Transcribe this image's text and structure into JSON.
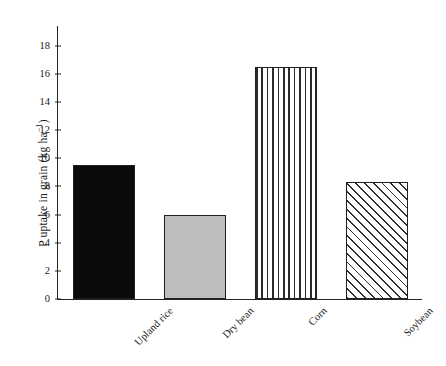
{
  "chart_data": {
    "type": "bar",
    "title": "",
    "subtitle": "",
    "xlabel": "",
    "ylabel": "P uptake in grain (kg ha−1)",
    "ylabel_parts": {
      "main": "P uptake in grain (kg ha",
      "sup": "−1",
      "tail": ")"
    },
    "categories": [
      "Upland rice",
      "Dry bean",
      "Corn",
      "Soybean"
    ],
    "values": [
      9.5,
      6.0,
      16.5,
      8.3
    ],
    "ylim": [
      0,
      19.4
    ],
    "yticks": [
      0,
      2,
      4,
      6,
      8,
      10,
      12,
      14,
      16,
      18
    ],
    "ytick_labels": [
      "0",
      "2",
      "4",
      "6",
      "8",
      "10",
      "12",
      "14",
      "16",
      "18"
    ],
    "grid": false,
    "legend": false,
    "legend_position": "none",
    "bar_styles": [
      "solid-black",
      "solid-gray",
      "vstripe",
      "diag"
    ],
    "bar_colors": [
      "#0a0a0a",
      "#bdbdbd",
      "#ffffff",
      "#ffffff"
    ],
    "edge_color": "#202020",
    "axis_color": "#262626",
    "background": "#ffffff",
    "xtick_rotation": -45
  }
}
